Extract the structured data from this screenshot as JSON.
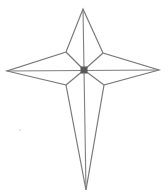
{
  "figure": {
    "shape": "four-pointed-star-cross",
    "colors": {
      "outline": "#7a7a7a",
      "axis_lines": "#7f7f7f",
      "center_square": "#5a5a5a",
      "background": "#ffffff"
    },
    "points": [
      "top",
      "right",
      "bottom",
      "left"
    ],
    "inner_vertices": [
      "upper-left",
      "upper-right",
      "lower-right",
      "lower-left"
    ],
    "has_center_square": true,
    "has_axis_lines": true,
    "has_diagonal_spokes": true
  }
}
